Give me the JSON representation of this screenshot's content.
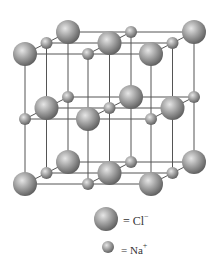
{
  "lattice": {
    "origin": {
      "x": 68,
      "y": 32
    },
    "column_step": {
      "dx": 63,
      "dy": 0
    },
    "row_step": {
      "dx": -21.5,
      "dy": 11
    },
    "layer_step": {
      "dx": 0,
      "dy": 65
    },
    "size": 3,
    "line_color": "#555555",
    "large_radius": 12,
    "small_radius": 6
  },
  "legend": {
    "items": [
      {
        "ion": "Cl",
        "charge": "−",
        "label": "= Cl",
        "size": "large"
      },
      {
        "ion": "Na",
        "charge": "+",
        "label": "= Na",
        "size": "small"
      }
    ]
  },
  "colors": {
    "sphere_light": "#d8d8d8",
    "sphere_mid": "#9a9a9a",
    "sphere_dark": "#5e5e5e",
    "text": "#333333"
  }
}
